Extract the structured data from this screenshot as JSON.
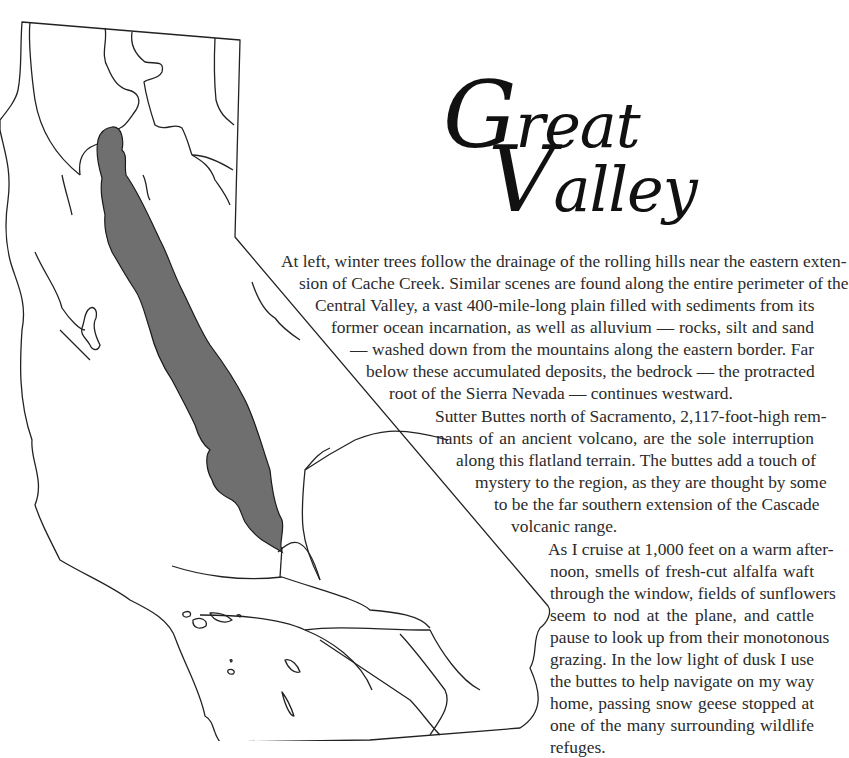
{
  "title": {
    "line1_cap": "G",
    "line1_rest": "reat",
    "line2_cap": "V",
    "line2_rest": "alley"
  },
  "map": {
    "subject": "California outline map with Great Valley (Central Valley) shaded",
    "valley_fill": "#6f6f6f",
    "outline_color": "#222222",
    "background": "#ffffff"
  },
  "paragraphs": [
    {
      "lines": [
        "At left, winter trees follow the drainage of the rolling hills near the eastern exten-",
        "sion of Cache Creek. Similar scenes are found along the entire perimeter of the",
        "Central Valley, a vast 400-mile-long plain filled with sediments from its",
        "former ocean incarnation, as well as alluvium — rocks, silt and sand",
        "— washed down from the mountains along the eastern border. Far",
        "below these accumulated deposits, the bedrock — the protracted",
        "root of the Sierra Nevada — continues westward."
      ]
    },
    {
      "lines": [
        "Sutter Buttes north of Sacramento, 2,117-foot-high rem-",
        "nants of an ancient volcano, are the sole interruption",
        "along this flatland terrain. The buttes add a touch of",
        "mystery to the region, as they are thought by some",
        "to be the far southern extension of the Cascade",
        "volcanic range."
      ]
    },
    {
      "lines": [
        "As I cruise at 1,000 feet on a warm after-",
        "noon, smells of fresh-cut alfalfa waft",
        "through the window, fields of sunflowers",
        "seem to nod at the plane, and cattle",
        "pause to look up from their monotonous",
        "grazing. In the low light of dusk I use",
        "the buttes to help navigate on my way",
        "home, passing snow geese stopped at",
        "one of the many surrounding wildlife",
        "refuges."
      ]
    }
  ]
}
